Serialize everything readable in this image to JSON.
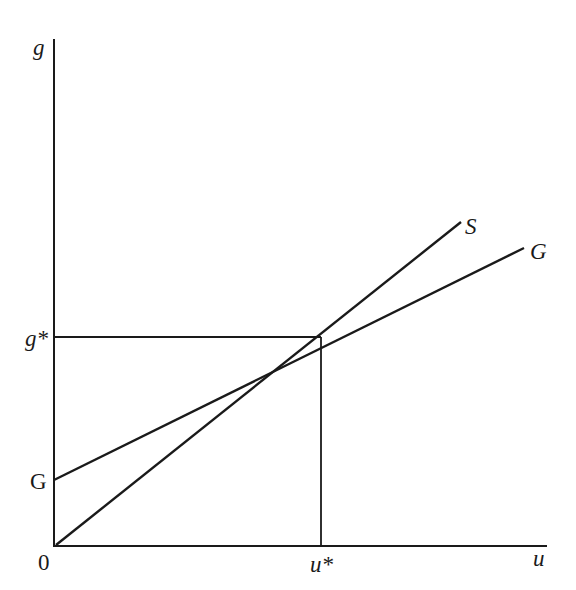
{
  "diagram": {
    "axes": {
      "y_label": "g",
      "x_label": "u",
      "origin_label": "0"
    },
    "equilibrium": {
      "g_star_label": "g*",
      "u_star_label": "u*"
    },
    "lines": [
      {
        "name": "S",
        "label": "S",
        "description": "line from origin through equilibrium"
      },
      {
        "name": "G",
        "label": "G",
        "intercept_label": "G",
        "description": "line with positive intercept through equilibrium, flatter than S"
      }
    ],
    "colors": {
      "ink": "#1a1a1a",
      "background": "#ffffff"
    }
  }
}
